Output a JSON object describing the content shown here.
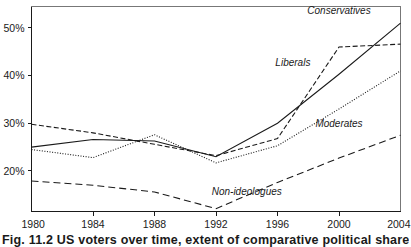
{
  "chart_data": {
    "type": "line",
    "title": "",
    "xlabel": "",
    "ylabel": "",
    "x": [
      1980,
      1984,
      1988,
      1992,
      1996,
      2000,
      2004
    ],
    "xtick_labels": [
      "1980",
      "1984",
      "1988",
      "1992",
      "1996",
      "2000",
      "2004"
    ],
    "ytick_labels": [
      "20%",
      "30%",
      "40%",
      "50%"
    ],
    "ytick_values": [
      20,
      30,
      40,
      50
    ],
    "xlim": [
      1980,
      2004
    ],
    "ylim": [
      11.5,
      54.5
    ],
    "grid": false,
    "legend_position": "inline-annotations",
    "series": [
      {
        "name": "Conservatives",
        "line_style": "solid",
        "color": "#1a1a1a",
        "values": [
          25.0,
          26.6,
          26.3,
          23.0,
          30.0,
          40.3,
          51.0
        ],
        "label_x": 2000,
        "label_y": 53.0
      },
      {
        "name": "Liberals",
        "line_style": "dashed",
        "color": "#1a1a1a",
        "values": [
          29.8,
          28.0,
          25.6,
          23.2,
          26.8,
          46.0,
          46.6
        ],
        "label_x": 1997,
        "label_y": 42.0
      },
      {
        "name": "Moderates",
        "line_style": "dotted",
        "color": "#1a1a1a",
        "values": [
          24.5,
          22.8,
          27.6,
          21.7,
          25.3,
          33.0,
          41.0
        ],
        "label_x": 2000,
        "label_y": 29.2
      },
      {
        "name": "Non-ideologues",
        "line_style": "longdash",
        "color": "#1a1a1a",
        "values": [
          17.9,
          17.0,
          15.6,
          12.1,
          17.6,
          22.7,
          27.5
        ],
        "label_x": 1994,
        "label_y": 15.0
      }
    ]
  },
  "caption": {
    "text": "Fig. 11.2  US voters over time, extent of comparative political shares, 1980-2004"
  }
}
